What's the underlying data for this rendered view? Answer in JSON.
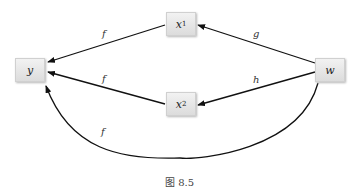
{
  "nodes": {
    "y": {
      "label": "y"
    },
    "x1": {
      "label": "x",
      "sub": "1"
    },
    "x2": {
      "label": "x",
      "sub": "2"
    },
    "w": {
      "label": "w"
    }
  },
  "edges": [
    {
      "from": "x1",
      "to": "y",
      "label": "f"
    },
    {
      "from": "x2",
      "to": "y",
      "label": "f"
    },
    {
      "from": "w",
      "to": "x1",
      "label": "g"
    },
    {
      "from": "w",
      "to": "x2",
      "label": "h"
    },
    {
      "from": "w",
      "to": "y",
      "label": "f"
    }
  ],
  "caption": "图   8.5"
}
